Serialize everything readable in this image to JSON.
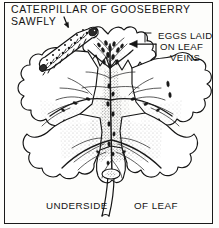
{
  "figure": {
    "kind": "line-drawing-illustration",
    "ink_color": "#141414",
    "paper_color": "#fdfdfb",
    "border_color": "#1b1b1b"
  },
  "labels": {
    "title_line1": "CATERPILLAR OF GOOSEBERRY",
    "title_line2": "SAWFLY",
    "eggs_line1": "EGGS LAID",
    "eggs_line2": "ON LEAF",
    "eggs_line3": "VEINS",
    "caption_left": "UNDERSIDE",
    "caption_right": "OF LEAF"
  },
  "icons": {
    "sawfly_pointer": "down-arrow-icon",
    "eggs_pointer": "left-arrow-icon"
  },
  "subjects": {
    "caterpillar": "gooseberry-sawfly-caterpillar",
    "leaf": "gooseberry-leaf-underside",
    "eggs": "sawfly-egg-cluster",
    "stalk": "leaf-stalk"
  }
}
